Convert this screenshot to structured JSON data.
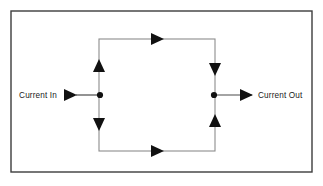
{
  "figure": {
    "type": "circuit-schematic",
    "frame": {
      "name": "outer-border",
      "x": 11,
      "y": 11,
      "width": 301,
      "height": 161,
      "stroke": "#3d3d3d",
      "stroke_width": 1.4,
      "fill": "#ffffff"
    },
    "loop": {
      "name": "current-loop-rectangle",
      "x": 99,
      "y": 39,
      "width": 116,
      "height": 112,
      "stroke": "#8c8c8c",
      "stroke_width": 1.1,
      "fill": "none"
    },
    "colors": {
      "background": "#ffffff",
      "border": "#3d3d3d",
      "loop_wire": "#8c8c8c",
      "lead_wire": "#4a4a4a",
      "arrow": "#111111",
      "node": "#111111",
      "text": "#1a1a1a"
    },
    "labels": {
      "current_in": "Current In",
      "current_out": "Current Out"
    },
    "nodes": [
      {
        "name": "input-junction-node",
        "x": 100,
        "y": 95,
        "r": 3.1
      },
      {
        "name": "output-junction-node",
        "x": 214,
        "y": 95,
        "r": 3.1
      }
    ],
    "leads": [
      {
        "name": "input-lead-wire",
        "x1": 76,
        "y1": 95,
        "x2": 100,
        "y2": 95
      },
      {
        "name": "output-lead-wire",
        "x1": 214,
        "y1": 95,
        "x2": 252,
        "y2": 95
      }
    ],
    "arrows": [
      {
        "name": "input-current-arrow",
        "direction": "right",
        "tip_x": 77,
        "tip_y": 95,
        "length": 13,
        "half_width": 6.0
      },
      {
        "name": "output-current-arrow",
        "direction": "right",
        "tip_x": 253,
        "tip_y": 95,
        "length": 13,
        "half_width": 6.0
      },
      {
        "name": "top-branch-flow-arrow",
        "direction": "right",
        "tip_x": 164,
        "tip_y": 39,
        "length": 13,
        "half_width": 6.0
      },
      {
        "name": "bottom-branch-flow-arrow",
        "direction": "right",
        "tip_x": 164,
        "tip_y": 151,
        "length": 13,
        "half_width": 6.0
      },
      {
        "name": "left-upper-branch-arrow",
        "direction": "up",
        "tip_x": 99,
        "tip_y": 59,
        "length": 13,
        "half_width": 6.0
      },
      {
        "name": "left-lower-branch-arrow",
        "direction": "down",
        "tip_x": 99,
        "tip_y": 131,
        "length": 13,
        "half_width": 6.0
      },
      {
        "name": "right-upper-branch-arrow",
        "direction": "down",
        "tip_x": 215,
        "tip_y": 76,
        "length": 13,
        "half_width": 6.0
      },
      {
        "name": "right-lower-branch-arrow",
        "direction": "up",
        "tip_x": 215,
        "tip_y": 114,
        "length": 13,
        "half_width": 6.0
      }
    ],
    "text_positions": {
      "current_in": {
        "x": 57,
        "y": 98,
        "anchor": "end"
      },
      "current_out": {
        "x": 258,
        "y": 98,
        "anchor": "start"
      }
    }
  }
}
